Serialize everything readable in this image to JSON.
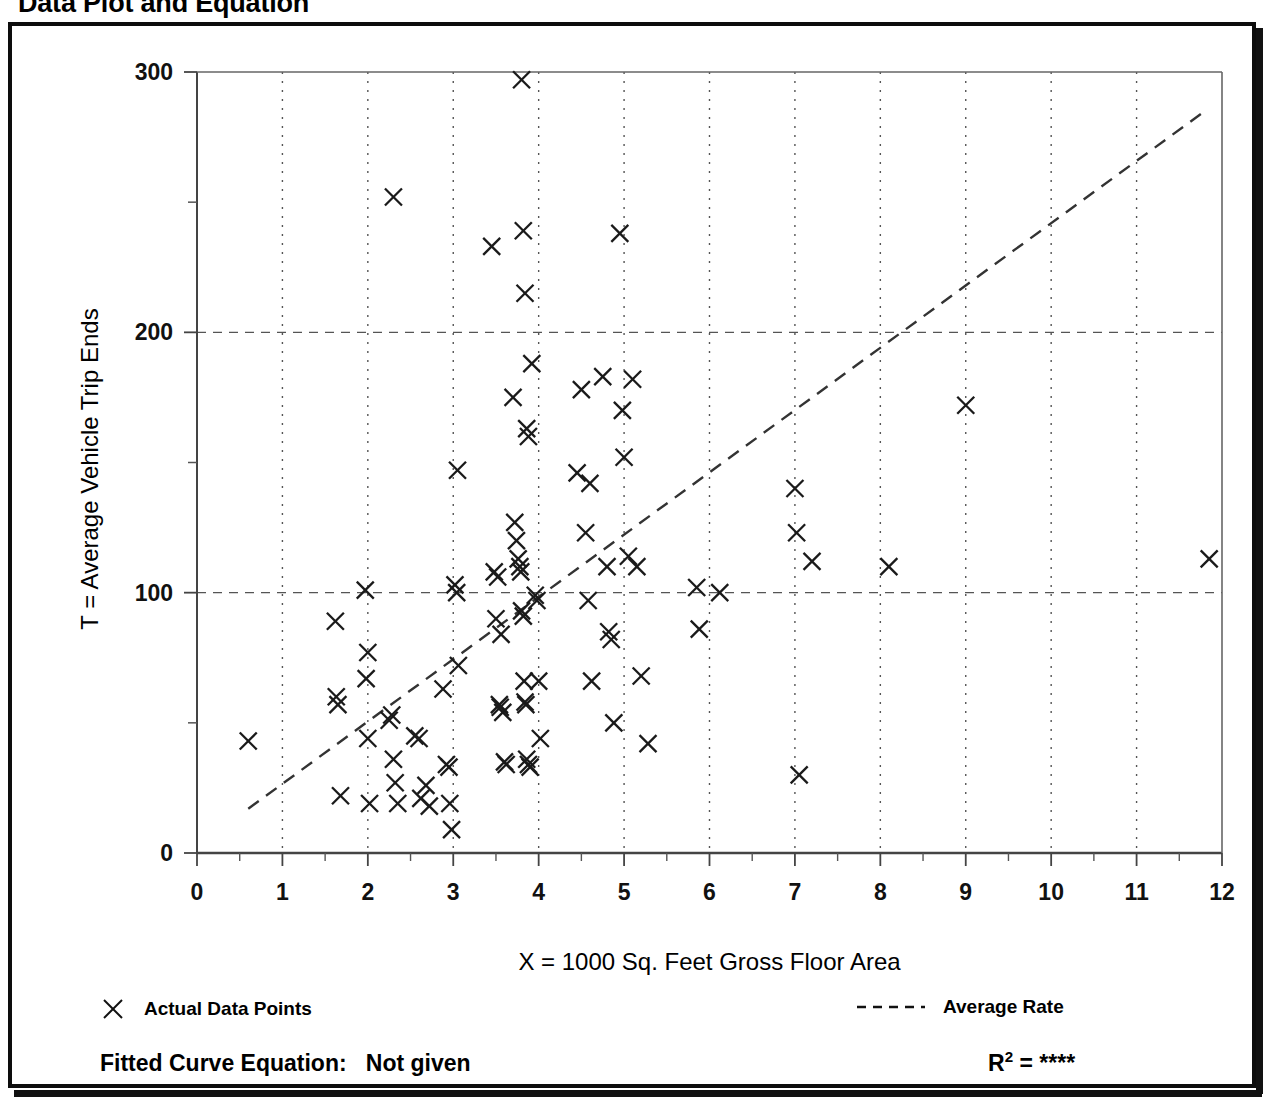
{
  "page_title": "Data Plot and Equation",
  "axes": {
    "xlabel": "X = 1000 Sq. Feet Gross Floor Area",
    "ylabel": "T = Average Vehicle Trip Ends",
    "x_ticks": [
      "0",
      "1",
      "2",
      "3",
      "4",
      "5",
      "6",
      "7",
      "8",
      "9",
      "10",
      "11",
      "12"
    ],
    "y_ticks": [
      "0",
      "100",
      "200",
      "300"
    ]
  },
  "legend": {
    "points_label": "Actual Data Points",
    "points_marker": "x-marker-icon",
    "rate_label": "Average Rate",
    "rate_marker": "dashed-line-icon"
  },
  "footer": {
    "equation_label": "Fitted Curve Equation:",
    "equation_value": "Not given",
    "r2_label": "R",
    "r2_exponent": "2",
    "r2_equals": "=",
    "r2_value": "****"
  },
  "chart_data": {
    "type": "scatter",
    "title": "Data Plot and Equation",
    "xlabel": "X = 1000 Sq. Feet Gross Floor Area",
    "ylabel": "T = Average Vehicle Trip Ends",
    "xlim": [
      0,
      12
    ],
    "ylim": [
      0,
      300
    ],
    "x_major_ticks": [
      0,
      1,
      2,
      3,
      4,
      5,
      6,
      7,
      8,
      9,
      10,
      11,
      12
    ],
    "y_major_ticks": [
      0,
      100,
      200,
      300
    ],
    "y_minor_ticks": [
      50,
      150,
      250
    ],
    "grid": "dotted vertical at every integer x; dashed horizontal at y=100 and y=200",
    "legend_position": "below-plot",
    "marker": "x",
    "series": [
      {
        "name": "Actual Data Points",
        "points": [
          [
            0.6,
            43
          ],
          [
            1.62,
            89
          ],
          [
            1.63,
            60
          ],
          [
            1.65,
            57
          ],
          [
            1.68,
            22
          ],
          [
            1.97,
            101
          ],
          [
            1.98,
            67
          ],
          [
            2.0,
            77
          ],
          [
            2.0,
            44
          ],
          [
            2.02,
            19
          ],
          [
            2.25,
            51
          ],
          [
            2.28,
            53
          ],
          [
            2.3,
            36
          ],
          [
            2.32,
            27
          ],
          [
            2.35,
            19
          ],
          [
            2.55,
            45
          ],
          [
            2.6,
            44
          ],
          [
            2.62,
            21
          ],
          [
            2.68,
            26
          ],
          [
            2.72,
            18
          ],
          [
            2.88,
            63
          ],
          [
            2.92,
            34
          ],
          [
            2.95,
            33
          ],
          [
            2.96,
            19
          ],
          [
            2.98,
            9
          ],
          [
            3.02,
            103
          ],
          [
            3.04,
            100
          ],
          [
            3.05,
            147
          ],
          [
            3.06,
            72
          ],
          [
            3.45,
            233
          ],
          [
            3.48,
            108
          ],
          [
            3.5,
            90
          ],
          [
            3.52,
            106
          ],
          [
            3.54,
            57
          ],
          [
            3.55,
            56
          ],
          [
            3.56,
            84
          ],
          [
            3.58,
            54
          ],
          [
            3.6,
            35
          ],
          [
            3.62,
            34
          ],
          [
            3.7,
            175
          ],
          [
            3.72,
            127
          ],
          [
            3.74,
            120
          ],
          [
            3.76,
            113
          ],
          [
            3.78,
            110
          ],
          [
            3.79,
            108
          ],
          [
            3.8,
            93
          ],
          [
            3.82,
            91
          ],
          [
            3.83,
            66
          ],
          [
            3.84,
            58
          ],
          [
            3.85,
            57
          ],
          [
            3.86,
            36
          ],
          [
            3.88,
            34
          ],
          [
            3.9,
            33
          ],
          [
            3.8,
            297
          ],
          [
            3.82,
            239
          ],
          [
            3.84,
            215
          ],
          [
            3.86,
            163
          ],
          [
            3.88,
            160
          ],
          [
            3.92,
            188
          ],
          [
            3.96,
            99
          ],
          [
            3.98,
            97
          ],
          [
            4.0,
            66
          ],
          [
            4.02,
            44
          ],
          [
            2.3,
            252
          ],
          [
            4.45,
            146
          ],
          [
            4.5,
            178
          ],
          [
            4.55,
            123
          ],
          [
            4.58,
            97
          ],
          [
            4.6,
            142
          ],
          [
            4.62,
            66
          ],
          [
            4.75,
            183
          ],
          [
            4.8,
            110
          ],
          [
            4.82,
            85
          ],
          [
            4.85,
            82
          ],
          [
            4.88,
            50
          ],
          [
            4.95,
            238
          ],
          [
            4.98,
            170
          ],
          [
            5.0,
            152
          ],
          [
            5.05,
            114
          ],
          [
            5.1,
            182
          ],
          [
            5.15,
            110
          ],
          [
            5.2,
            68
          ],
          [
            5.28,
            42
          ],
          [
            5.85,
            102
          ],
          [
            5.88,
            86
          ],
          [
            6.12,
            100
          ],
          [
            7.0,
            140
          ],
          [
            7.02,
            123
          ],
          [
            7.05,
            30
          ],
          [
            7.2,
            112
          ],
          [
            8.1,
            110
          ],
          [
            9.0,
            172
          ],
          [
            11.85,
            113
          ]
        ]
      }
    ],
    "trend_line": {
      "name": "Average Rate",
      "style": "dashed",
      "x_start": 0.6,
      "y_start": 17,
      "x_end": 11.8,
      "y_end": 285
    }
  }
}
